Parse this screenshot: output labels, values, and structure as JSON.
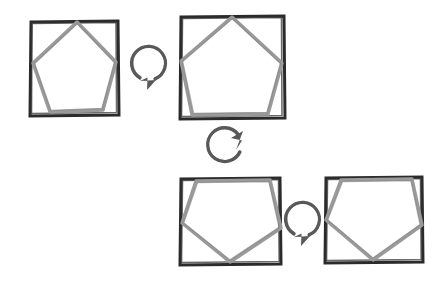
{
  "canvas": {
    "width": 448,
    "height": 288,
    "background": "#ffffff",
    "style": "hand-drawn-sketch"
  },
  "colors": {
    "frame_stroke": "#2b2b2b",
    "pentagon_stroke": "#9a9a9a",
    "pentagon_stroke_dark": "#8a8a8a",
    "arrow_stroke": "#595959",
    "background": "#ffffff"
  },
  "panels": [
    {
      "id": "panel-1",
      "name": "square-with-pentagon-upright",
      "square": {
        "x": 30,
        "y": 21,
        "width": 88,
        "height": 94
      },
      "pentagon": {
        "orientation": "point-up",
        "rotation_deg": 5,
        "vertices": [
          [
            77,
            22
          ],
          [
            116,
            62
          ],
          [
            103,
            110
          ],
          [
            50,
            112
          ],
          [
            33,
            63
          ]
        ]
      }
    },
    {
      "id": "panel-2",
      "name": "square-with-pentagon-upright",
      "square": {
        "x": 180,
        "y": 16,
        "width": 104,
        "height": 102
      },
      "pentagon": {
        "orientation": "point-up",
        "rotation_deg": 5,
        "vertices": [
          [
            232,
            17
          ],
          [
            282,
            63
          ],
          [
            268,
            114
          ],
          [
            192,
            115
          ],
          [
            181,
            61
          ]
        ]
      }
    },
    {
      "id": "panel-3",
      "name": "square-with-pentagon-inverted",
      "square": {
        "x": 180,
        "y": 178,
        "width": 100,
        "height": 86
      },
      "pentagon": {
        "orientation": "point-down",
        "rotation_deg": 185,
        "vertices": [
          [
            196,
            181
          ],
          [
            270,
            180
          ],
          [
            281,
            228
          ],
          [
            230,
            262
          ],
          [
            182,
            223
          ]
        ]
      }
    },
    {
      "id": "panel-4",
      "name": "square-with-pentagon-inverted",
      "square": {
        "x": 325,
        "y": 177,
        "width": 97,
        "height": 85
      },
      "pentagon": {
        "orientation": "point-down",
        "rotation_deg": 185,
        "vertices": [
          [
            341,
            180
          ],
          [
            412,
            179
          ],
          [
            422,
            225
          ],
          [
            373,
            260
          ],
          [
            326,
            220
          ]
        ]
      }
    }
  ],
  "arrows": [
    {
      "id": "arrow-1",
      "name": "rotation-arrow-clockwise",
      "from_panel": "panel-1",
      "to_panel": "panel-2",
      "center": [
        149,
        66
      ],
      "radius": 17,
      "head_position": "bottom-left",
      "head_direction": "down-left"
    },
    {
      "id": "arrow-2",
      "name": "rotation-arrow-clockwise",
      "from_panel": "panel-2",
      "to_panel": "panel-3",
      "center": [
        229,
        143
      ],
      "radius": 17,
      "head_position": "top-right",
      "head_direction": "up-right"
    },
    {
      "id": "arrow-3",
      "name": "rotation-arrow-clockwise",
      "from_panel": "panel-3",
      "to_panel": "panel-4",
      "center": [
        303,
        222
      ],
      "radius": 17,
      "head_position": "bottom-left",
      "head_direction": "down-left"
    }
  ],
  "sequence": {
    "description": "Four framed pentagons connected by three rotation arrows",
    "step_count": 4,
    "arrow_count": 3
  }
}
